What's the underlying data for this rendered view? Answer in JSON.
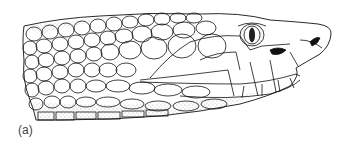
{
  "figure": {
    "panel_label": "(a)",
    "line_color": "#111111",
    "background": "#ffffff"
  }
}
